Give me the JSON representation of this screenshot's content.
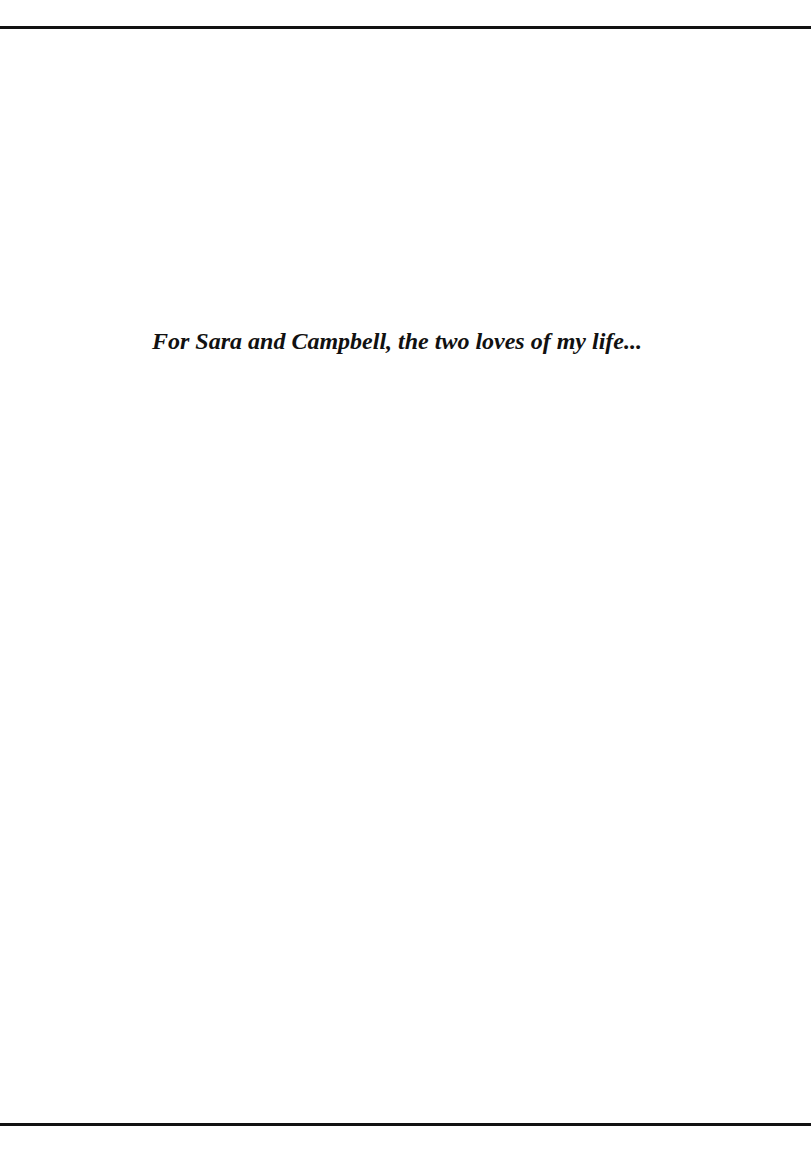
{
  "page": {
    "dedication": "For Sara and Campbell, the two loves of my life..."
  }
}
